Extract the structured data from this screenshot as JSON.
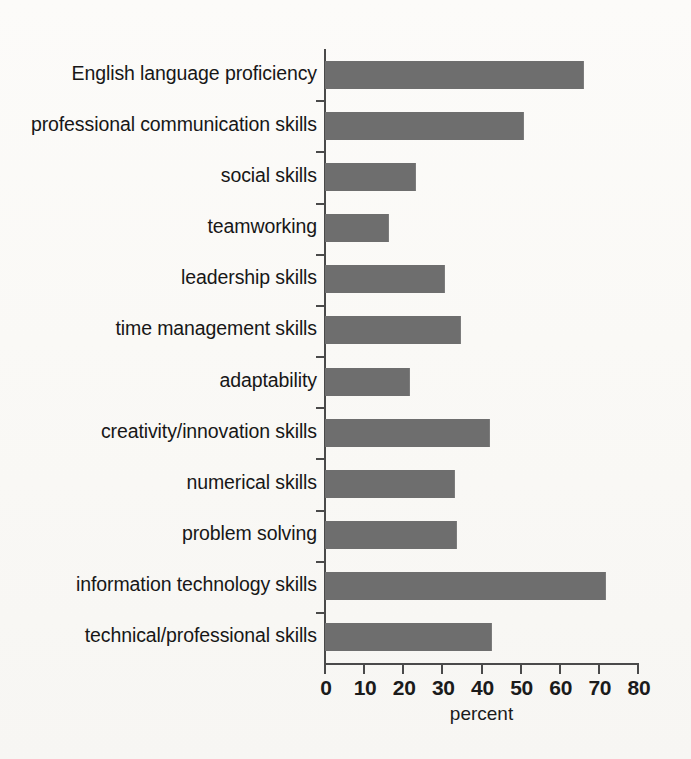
{
  "chart_data": {
    "type": "bar",
    "orientation": "horizontal",
    "title": "",
    "subtitle": "",
    "xlabel": "percent",
    "ylabel": "",
    "xlim": [
      0,
      80
    ],
    "xticks": [
      0,
      10,
      20,
      30,
      40,
      50,
      60,
      70,
      80
    ],
    "xtick_labels": [
      "0",
      "10",
      "20",
      "30",
      "40",
      "50",
      "60",
      "70",
      "80"
    ],
    "grid": false,
    "legend": false,
    "legend_position": "none",
    "bar_color": "#6e6e6e",
    "background_color": "#fbfaf8",
    "axis_color": "#4a4a4a",
    "categories": [
      "English language proficiency",
      "professional communication skills",
      "social skills",
      "teamworking",
      "leadership skills",
      "time management  skills",
      "adaptability",
      "creativity/innovation skills",
      "numerical skills",
      "problem solving",
      "information technology skills",
      "technical/professional skills"
    ],
    "values": [
      66,
      50.5,
      23,
      16,
      30.5,
      34.5,
      21.5,
      42,
      33,
      33.5,
      71.5,
      42.5
    ],
    "series": [
      {
        "name": "percent",
        "values": [
          66,
          50.5,
          23,
          16,
          30.5,
          34.5,
          21.5,
          42,
          33,
          33.5,
          71.5,
          42.5
        ]
      }
    ],
    "annotations": []
  }
}
